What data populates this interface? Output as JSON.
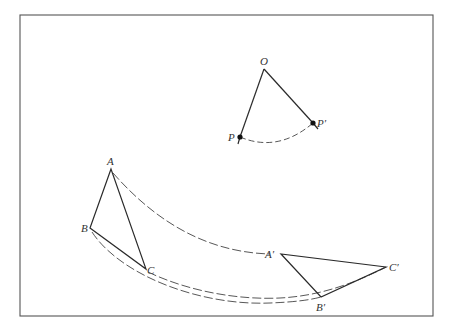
{
  "figure": {
    "frame": {
      "x1": 20,
      "y1": 15,
      "x2": 433,
      "y2": 316
    },
    "colors": {
      "stroke": "#2a2a2a",
      "dash": "#444444",
      "frame": "#555555",
      "background": "#ffffff"
    }
  },
  "rotation_point": {
    "center": {
      "label": "O",
      "x": 264,
      "y": 69
    },
    "point": {
      "label": "P",
      "x": 240,
      "y": 137
    },
    "image": {
      "label": "P′",
      "x": 313,
      "y": 123
    }
  },
  "triangle_original": {
    "A": {
      "label": "A",
      "x": 111,
      "y": 169
    },
    "B": {
      "label": "B",
      "x": 90,
      "y": 228
    },
    "C": {
      "label": "C",
      "x": 146,
      "y": 269
    }
  },
  "triangle_image": {
    "A": {
      "label": "A′",
      "x": 281,
      "y": 254
    },
    "B": {
      "label": "B′",
      "x": 321,
      "y": 297
    },
    "C": {
      "label": "C′",
      "x": 386,
      "y": 267
    }
  },
  "labels": {
    "O": "O",
    "P": "P",
    "P_prime": "P′",
    "A": "A",
    "B": "B",
    "C": "C",
    "A_prime": "A′",
    "B_prime": "B′",
    "C_prime": "C′"
  }
}
